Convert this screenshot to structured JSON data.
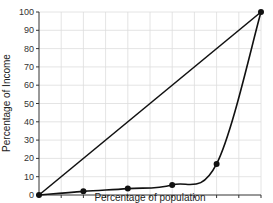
{
  "chart_data": {
    "type": "line",
    "title": "",
    "xlabel": "Percentage of population",
    "ylabel": "Percentage of Income",
    "xlim": [
      0,
      100
    ],
    "ylim": [
      0,
      100
    ],
    "x_ticks": [
      0,
      10,
      20,
      30,
      40,
      50,
      60,
      70,
      80,
      90,
      100
    ],
    "y_ticks": [
      0,
      10,
      20,
      30,
      40,
      50,
      60,
      70,
      80,
      90,
      100
    ],
    "grid": true,
    "legend": null,
    "series": [
      {
        "name": "Line of equality",
        "x": [
          0,
          100
        ],
        "values": [
          0,
          100
        ],
        "markers": false
      },
      {
        "name": "Lorenz curve",
        "x": [
          0,
          20,
          40,
          60,
          80,
          100
        ],
        "values": [
          0,
          2,
          3.5,
          5.5,
          17,
          100
        ],
        "markers": true
      }
    ]
  },
  "colors": {
    "line": "#111111",
    "grid": "#dddddd",
    "axis": "#333333"
  }
}
